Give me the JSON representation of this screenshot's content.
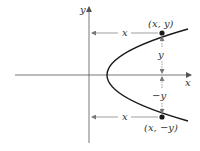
{
  "diagram": {
    "axes": {
      "x_label": "x",
      "y_label": "y"
    },
    "curve": {
      "type": "parabola opening left",
      "color": "#1a1a1a"
    },
    "points": [
      {
        "label": "(x, y)"
      },
      {
        "label": "(x, −y)"
      }
    ],
    "distance_labels": {
      "top_horizontal": "x",
      "bottom_horizontal": "x",
      "upper_vertical": "y",
      "lower_vertical": "−y"
    },
    "colors": {
      "axis": "#555555",
      "curve": "#1a1a1a",
      "arrow": "#777777",
      "text": "#333333"
    }
  }
}
